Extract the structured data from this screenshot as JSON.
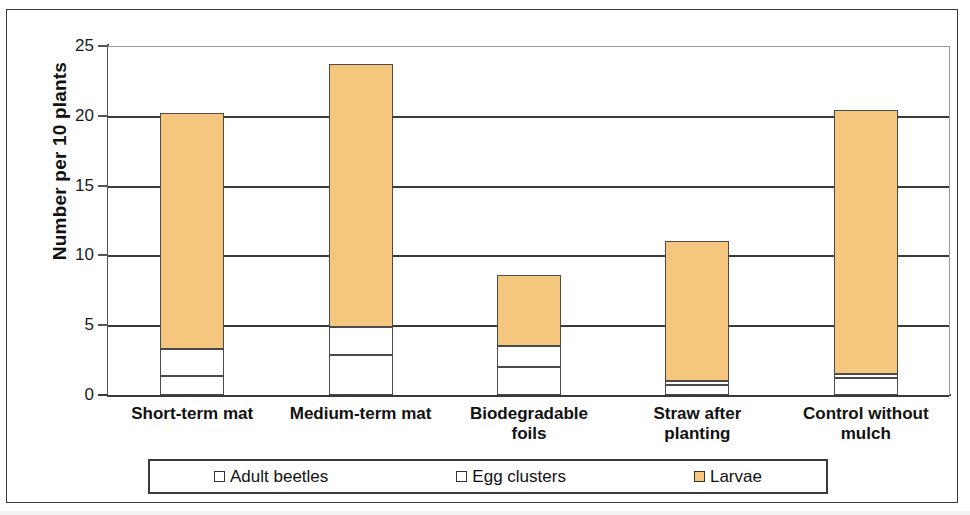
{
  "chart_data": {
    "type": "bar",
    "subtype": "stacked-bar",
    "title": "",
    "xlabel": "",
    "ylabel": "Number per 10 plants",
    "ylim": [
      0,
      25
    ],
    "yticks": [
      0,
      5,
      10,
      15,
      20,
      25
    ],
    "ytick_labels": [
      "0",
      "5",
      "10",
      "15",
      "20",
      "25"
    ],
    "grid": "horizontal",
    "legend_position": "bottom",
    "categories": [
      "Short-term mat",
      "Medium-term mat",
      "Biodegradable foils",
      "Straw after planting",
      "Control without mulch"
    ],
    "series": [
      {
        "name": "Adult beetles",
        "color": "#ffffff",
        "values": [
          1.35,
          2.9,
          2.0,
          0.7,
          1.2
        ]
      },
      {
        "name": "Egg clusters",
        "color": "#ffffff",
        "values": [
          1.95,
          2.0,
          1.5,
          0.3,
          0.3
        ]
      },
      {
        "name": "Larvae",
        "color": "#f5c67e",
        "values": [
          16.9,
          18.8,
          5.1,
          10.0,
          18.9
        ]
      }
    ],
    "totals": [
      20.2,
      23.7,
      8.6,
      11.0,
      20.4
    ]
  },
  "axis": {
    "y_title": "Number per 10 plants",
    "ticks": [
      {
        "label": "25",
        "value": 25
      },
      {
        "label": "20",
        "value": 20
      },
      {
        "label": "15",
        "value": 15
      },
      {
        "label": "10",
        "value": 10
      },
      {
        "label": "5",
        "value": 5
      },
      {
        "label": "0",
        "value": 0
      }
    ]
  },
  "categories": [
    {
      "line1": "Short-term mat",
      "line2": ""
    },
    {
      "line1": "Medium-term mat",
      "line2": ""
    },
    {
      "line1": "Biodegradable",
      "line2": "foils"
    },
    {
      "line1": "Straw after",
      "line2": "planting"
    },
    {
      "line1": "Control without",
      "line2": "mulch"
    }
  ],
  "legend": {
    "items": [
      {
        "label": "Adult beetles",
        "color": "#ffffff"
      },
      {
        "label": "Egg clusters",
        "color": "#ffffff"
      },
      {
        "label": "Larvae",
        "color": "#f5c67e"
      }
    ]
  }
}
